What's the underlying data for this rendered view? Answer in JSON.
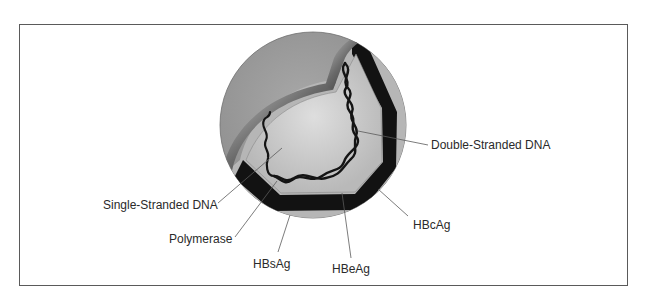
{
  "figure": {
    "labels": {
      "double_stranded_dna": "Double-Stranded DNA",
      "single_stranded_dna": "Single-Stranded DNA",
      "polymerase": "Polymerase",
      "hbcag": "HBcAg",
      "hbsag": "HBsAg",
      "hbeag": "HBeAg"
    },
    "colors": {
      "outer_envelope": "#9c9c9c",
      "outer_ring": "#b8b8b8",
      "shell_dark": "#111111",
      "core": "#c4c4c4",
      "core_highlight": "#dcdcdc",
      "dna": "#141414",
      "frame": "#5a5a5a",
      "leader": "#5a5a5a"
    }
  }
}
